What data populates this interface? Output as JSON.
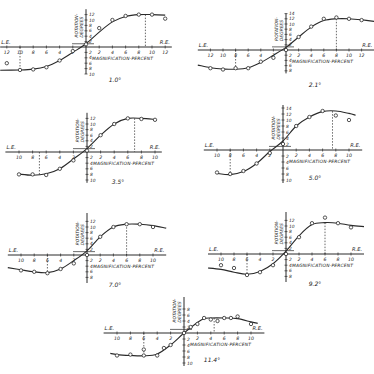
{
  "figure": {
    "axis_labels": {
      "left_end": "L.E.",
      "right_end": "R.E.",
      "x": "MAGNIFICATION-PERCENT",
      "y_line1": "ROTATION-",
      "y_line2": "DEGREES"
    },
    "colors": {
      "ink": "#2a2a2a",
      "background": "#ffffff"
    }
  },
  "chart_data": [
    {
      "type": "line",
      "title": "1.0°",
      "xlabel": "MAGNIFICATION-PERCENT",
      "ylabel": "ROTATION-DEGREES",
      "x_ticks": [
        -12,
        -10,
        -8,
        -6,
        -4,
        -2,
        2,
        4,
        6,
        8,
        10,
        12
      ],
      "y_ticks": [
        12,
        10,
        8,
        6,
        4,
        2,
        -2,
        -4,
        -6,
        -8,
        -10
      ],
      "xlim": [
        -12,
        12
      ],
      "ylim": [
        -10,
        14
      ],
      "peak_marker_x": 9,
      "trough_marker_x": -10,
      "points": [
        [
          -12,
          -6
        ],
        [
          -10,
          -8.5
        ],
        [
          -8,
          -8.3
        ],
        [
          -6,
          -7.5
        ],
        [
          -4,
          -5
        ],
        [
          -2,
          -1.5
        ],
        [
          0,
          1
        ],
        [
          2,
          7
        ],
        [
          4,
          10
        ],
        [
          6,
          11.5
        ],
        [
          8,
          12
        ],
        [
          10,
          12
        ],
        [
          12,
          10.5
        ]
      ],
      "curve": [
        [
          -13,
          -8.6
        ],
        [
          -10,
          -8.5
        ],
        [
          -8,
          -8.2
        ],
        [
          -6,
          -7.2
        ],
        [
          -4,
          -5
        ],
        [
          -2,
          -2
        ],
        [
          0,
          1.2
        ],
        [
          2,
          5.5
        ],
        [
          4,
          9.3
        ],
        [
          6,
          11.3
        ],
        [
          8,
          12
        ],
        [
          10,
          12
        ],
        [
          12,
          11.8
        ]
      ]
    },
    {
      "type": "line",
      "title": "2.1°",
      "xlabel": "MAGNIFICATION-PERCENT",
      "ylabel": "ROTATION-DEGREES",
      "x_ticks": [
        -12,
        -10,
        -8,
        -6,
        -4,
        -2,
        2,
        4,
        6,
        8,
        10,
        12
      ],
      "y_ticks": [
        14,
        12,
        10,
        8,
        6,
        4,
        2,
        -2,
        -4,
        -6,
        -8
      ],
      "xlim": [
        -12,
        12
      ],
      "ylim": [
        -8,
        14
      ],
      "peak_marker_x": 8,
      "trough_marker_x": -8,
      "points": [
        [
          -12,
          -7
        ],
        [
          -10,
          -7.5
        ],
        [
          -8,
          -7
        ],
        [
          -6,
          -7
        ],
        [
          -4,
          -4.5
        ],
        [
          -2,
          -3
        ],
        [
          0,
          0
        ],
        [
          2,
          5
        ],
        [
          4,
          9
        ],
        [
          6,
          12
        ],
        [
          8,
          12.5
        ],
        [
          10,
          12
        ],
        [
          12,
          11.5
        ]
      ],
      "curve": [
        [
          -14,
          -5.8
        ],
        [
          -12,
          -6.8
        ],
        [
          -10,
          -7.3
        ],
        [
          -8,
          -7.4
        ],
        [
          -6,
          -6.8
        ],
        [
          -4,
          -4.8
        ],
        [
          -2,
          -2
        ],
        [
          0,
          1
        ],
        [
          2,
          5
        ],
        [
          4,
          8.8
        ],
        [
          6,
          11.3
        ],
        [
          8,
          12
        ],
        [
          10,
          12
        ],
        [
          12,
          11.6
        ],
        [
          14,
          11
        ]
      ]
    },
    {
      "type": "line",
      "title": "3.5°",
      "xlabel": "MAGNIFICATION-PERCENT",
      "ylabel": "ROTATION-DEGREES",
      "x_ticks": [
        -10,
        -8,
        -6,
        -4,
        -2,
        2,
        4,
        6,
        8,
        10
      ],
      "y_ticks": [
        12,
        10,
        8,
        6,
        4,
        2,
        -2,
        -4,
        -6,
        -8,
        -10
      ],
      "xlim": [
        -10,
        10
      ],
      "ylim": [
        -10,
        14
      ],
      "peak_marker_x": 7,
      "trough_marker_x": -7,
      "points": [
        [
          -10,
          -8
        ],
        [
          -8,
          -8
        ],
        [
          -6,
          -8.2
        ],
        [
          -4,
          -6
        ],
        [
          -2,
          -3
        ],
        [
          0,
          0.5
        ],
        [
          2,
          6
        ],
        [
          4,
          10
        ],
        [
          6,
          12
        ],
        [
          8,
          11.8
        ],
        [
          10,
          11.5
        ]
      ],
      "curve": [
        [
          -10,
          -7.9
        ],
        [
          -8,
          -8.3
        ],
        [
          -6,
          -7.8
        ],
        [
          -4,
          -6
        ],
        [
          -2,
          -2.5
        ],
        [
          0,
          1.2
        ],
        [
          2,
          6
        ],
        [
          4,
          10
        ],
        [
          6,
          12
        ],
        [
          8,
          12
        ],
        [
          10,
          11.6
        ]
      ]
    },
    {
      "type": "line",
      "title": "5.0°",
      "xlabel": "MAGNIFICATION-PERCENT",
      "ylabel": "ROTATION-DEGREES",
      "x_ticks": [
        -10,
        -8,
        -6,
        -4,
        -2,
        2,
        4,
        6,
        8,
        10
      ],
      "y_ticks": [
        14,
        12,
        10,
        8,
        6,
        4,
        2,
        -2,
        -4,
        -6,
        -8,
        -10
      ],
      "xlim": [
        -10,
        10
      ],
      "ylim": [
        -10,
        14
      ],
      "peak_marker_x": 7.5,
      "trough_marker_x": -8,
      "points": [
        [
          -10,
          -7.5
        ],
        [
          -8,
          -8
        ],
        [
          -6,
          -7
        ],
        [
          -4,
          -4.5
        ],
        [
          -2,
          -1
        ],
        [
          0,
          2
        ],
        [
          2,
          8
        ],
        [
          4,
          11
        ],
        [
          6,
          13
        ],
        [
          8,
          11.5
        ],
        [
          10,
          10
        ]
      ],
      "curve": [
        [
          -10,
          -7.8
        ],
        [
          -8,
          -8.2
        ],
        [
          -6,
          -7.2
        ],
        [
          -4,
          -4.5
        ],
        [
          -2,
          -0.5
        ],
        [
          0,
          3
        ],
        [
          2,
          8
        ],
        [
          4,
          11
        ],
        [
          6,
          12.8
        ],
        [
          8,
          13
        ],
        [
          10,
          12.2
        ],
        [
          11,
          11.6
        ]
      ]
    },
    {
      "type": "line",
      "title": "7.0°",
      "xlabel": "MAGNIFICATION-PERCENT",
      "ylabel": "ROTATION-DEGREES",
      "x_ticks": [
        -10,
        -8,
        -6,
        -4,
        -2,
        2,
        4,
        6,
        8,
        10
      ],
      "y_ticks": [
        12,
        10,
        8,
        6,
        4,
        2,
        -2,
        -4,
        -6,
        -8
      ],
      "xlim": [
        -10,
        10
      ],
      "ylim": [
        -8,
        14
      ],
      "peak_marker_x": 6,
      "trough_marker_x": -6,
      "points": [
        [
          -10,
          -5.5
        ],
        [
          -8,
          -6
        ],
        [
          -6,
          -6.5
        ],
        [
          -4,
          -5
        ],
        [
          -2,
          -3
        ],
        [
          0,
          0
        ],
        [
          2,
          6.5
        ],
        [
          4,
          10
        ],
        [
          6,
          11
        ],
        [
          8,
          11
        ],
        [
          10,
          10
        ]
      ],
      "curve": [
        [
          -12,
          -4.5
        ],
        [
          -10,
          -5.3
        ],
        [
          -8,
          -6
        ],
        [
          -6,
          -6.3
        ],
        [
          -4,
          -5
        ],
        [
          -2,
          -2
        ],
        [
          0,
          1.5
        ],
        [
          2,
          6.5
        ],
        [
          4,
          10
        ],
        [
          6,
          11
        ],
        [
          8,
          11
        ],
        [
          10,
          10.5
        ],
        [
          12,
          9.6
        ]
      ]
    },
    {
      "type": "line",
      "title": "9.2°",
      "xlabel": "MAGNIFICATION-PERCENT",
      "ylabel": "ROTATION-DEGREES",
      "x_ticks": [
        -10,
        -8,
        -6,
        -4,
        -2,
        2,
        4,
        6,
        8,
        10
      ],
      "y_ticks": [
        12,
        10,
        8,
        6,
        4,
        2,
        -2,
        -4,
        -6,
        -8
      ],
      "xlim": [
        -10,
        10
      ],
      "ylim": [
        -8,
        14
      ],
      "peak_marker_x": 6,
      "trough_marker_x": -6,
      "points": [
        [
          -10,
          -4
        ],
        [
          -8,
          -5
        ],
        [
          -6,
          -7.5
        ],
        [
          -4,
          -6.5
        ],
        [
          -2,
          -4
        ],
        [
          0,
          0
        ],
        [
          2,
          6
        ],
        [
          4,
          11
        ],
        [
          6,
          13
        ],
        [
          8,
          11
        ],
        [
          10,
          9.5
        ]
      ],
      "curve": [
        [
          -12,
          -5
        ],
        [
          -10,
          -5.5
        ],
        [
          -8,
          -6.5
        ],
        [
          -6,
          -7.2
        ],
        [
          -4,
          -6.2
        ],
        [
          -2,
          -3.5
        ],
        [
          0,
          1
        ],
        [
          2,
          6.5
        ],
        [
          4,
          10.5
        ],
        [
          6,
          11.2
        ],
        [
          8,
          11
        ],
        [
          10,
          10.2
        ],
        [
          12,
          9.8
        ]
      ]
    },
    {
      "type": "line",
      "title": "11.4°",
      "xlabel": "MAGNIFICATION-PERCENT",
      "ylabel": "ROTATION-DEGREES",
      "x_ticks": [
        -10,
        -8,
        -6,
        -4,
        -2,
        2,
        4,
        6,
        8,
        10
      ],
      "y_ticks": [
        8,
        6,
        4,
        2,
        -2,
        -4,
        -6,
        -8,
        -10
      ],
      "xlim": [
        -10,
        10
      ],
      "ylim": [
        -10,
        10
      ],
      "peak_marker_x": 4.5,
      "trough_marker_x": -6,
      "points": [
        [
          -10,
          -7.5
        ],
        [
          -8,
          -7.2
        ],
        [
          -6,
          -5.5
        ],
        [
          -6,
          -7.5
        ],
        [
          -4,
          -7.5
        ],
        [
          -3,
          -5
        ],
        [
          -2,
          -4
        ],
        [
          0,
          0
        ],
        [
          1,
          2
        ],
        [
          2,
          3
        ],
        [
          3,
          5
        ],
        [
          4,
          4.5
        ],
        [
          5,
          4
        ],
        [
          6,
          5
        ],
        [
          7,
          5
        ],
        [
          8,
          5.5
        ],
        [
          10,
          3
        ]
      ],
      "curve": [
        [
          -11,
          -6.8
        ],
        [
          -10,
          -7.2
        ],
        [
          -8,
          -7.5
        ],
        [
          -6,
          -7.6
        ],
        [
          -4,
          -7
        ],
        [
          -2,
          -4
        ],
        [
          0,
          0
        ],
        [
          2,
          3.5
        ],
        [
          3,
          4.8
        ],
        [
          4,
          5
        ],
        [
          6,
          5
        ],
        [
          8,
          4.8
        ],
        [
          10,
          3.7
        ],
        [
          11,
          3.2
        ]
      ]
    }
  ],
  "panels": [
    {
      "caption": "1.0°"
    },
    {
      "caption": "2.1°"
    },
    {
      "caption": "3.5°"
    },
    {
      "caption": "5.0°"
    },
    {
      "caption": "7.0°"
    },
    {
      "caption": "9.2°"
    },
    {
      "caption": "11.4°"
    }
  ]
}
